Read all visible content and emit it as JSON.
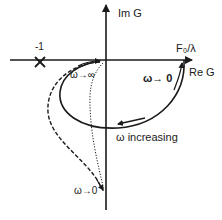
{
  "diagram": {
    "type": "nyquist-plot",
    "axes": {
      "imaginary_label": "Im G",
      "real_label": "Re G"
    },
    "critical_point": {
      "label": "-1",
      "marker": "x-mark"
    },
    "real_intercept_label": "F₀/λ",
    "annotations": {
      "omega_to_zero_main": "ω→ 0",
      "omega_to_infinity": "ω→∞",
      "omega_increasing": "ω increasing",
      "omega_to_zero_lower": "ω→0"
    },
    "curves": [
      {
        "name": "solid-semicircle",
        "style": "solid"
      },
      {
        "name": "dashed-curve",
        "style": "dashed"
      },
      {
        "name": "dotted-curve",
        "style": "dotted"
      }
    ],
    "colors": {
      "ink": "#1a1a1a",
      "background": "#ffffff"
    }
  }
}
